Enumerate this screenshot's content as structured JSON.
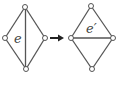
{
  "diagram": {
    "type": "graph-edge-flip",
    "left_graph": {
      "edge_label": "e",
      "vertices": [
        {
          "id": "top",
          "x": 25,
          "y": 7
        },
        {
          "id": "left",
          "x": 5,
          "y": 38
        },
        {
          "id": "right",
          "x": 45,
          "y": 38
        },
        {
          "id": "bottom",
          "x": 26,
          "y": 69
        }
      ],
      "edges": [
        [
          "top",
          "left"
        ],
        [
          "top",
          "right"
        ],
        [
          "left",
          "bottom"
        ],
        [
          "right",
          "bottom"
        ],
        [
          "top",
          "bottom"
        ]
      ],
      "highlighted_edge": [
        "top",
        "bottom"
      ]
    },
    "arrow": {
      "direction": "right"
    },
    "right_graph": {
      "edge_label": "e′",
      "vertices": [
        {
          "id": "top",
          "x": 91,
          "y": 6
        },
        {
          "id": "left",
          "x": 71,
          "y": 38
        },
        {
          "id": "right",
          "x": 113,
          "y": 38
        },
        {
          "id": "bottom",
          "x": 92,
          "y": 69
        }
      ],
      "edges": [
        [
          "top",
          "left"
        ],
        [
          "top",
          "right"
        ],
        [
          "left",
          "bottom"
        ],
        [
          "right",
          "bottom"
        ],
        [
          "left",
          "right"
        ]
      ],
      "highlighted_edge": [
        "left",
        "right"
      ]
    },
    "colors": {
      "stroke": "#555555",
      "arrow": "#222222",
      "background": "#ffffff"
    }
  }
}
